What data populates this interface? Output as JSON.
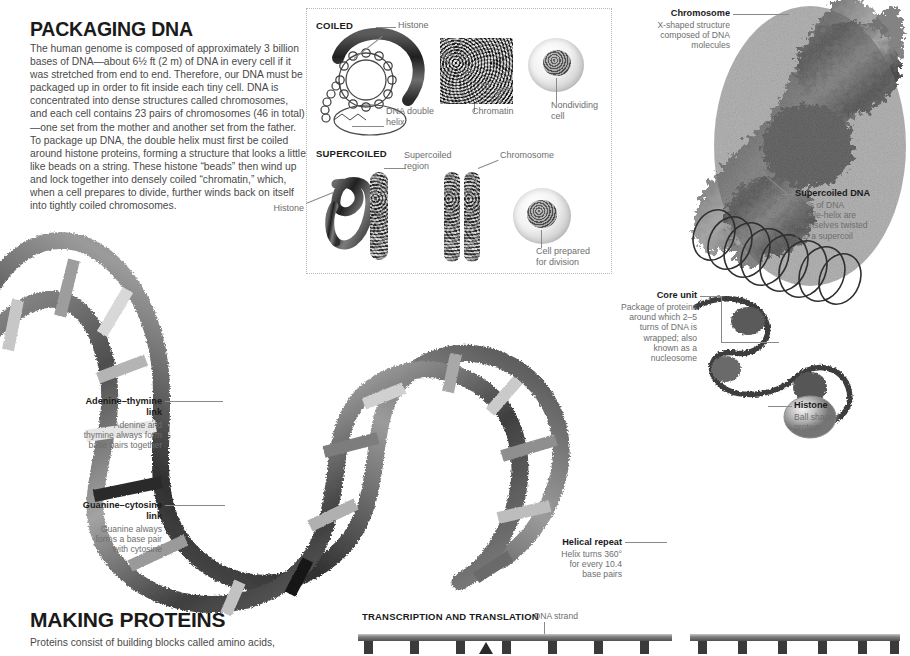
{
  "page": {
    "background": "#ffffff",
    "ink": "#3a3a3a",
    "heading_color": "#1a1a1a",
    "label_gray": "#6e6e6e",
    "leader_color": "#8a8a8a"
  },
  "sections": {
    "packaging": {
      "heading": "PACKAGING DNA",
      "body": "The human genome is composed of approximately 3 billion bases of DNA—about 6½ ft (2 m) of DNA in every cell if it was stretched from end to end. Therefore, our DNA must be packaged up in order to fit inside each tiny cell. DNA is concentrated into dense structures called chromosomes, and each cell contains 23 pairs of chromosomes (46 in total)—one set from the mother and another set from the father. To package up DNA, the double helix must first be coiled around histone proteins, forming a structure that looks a little like beads on a string. These histone “beads” then wind up and lock together into densely coiled “chromatin,” which, when a cell prepares to divide, further winds back on itself into tightly coiled chromosomes."
    },
    "making_proteins": {
      "heading": "MAKING PROTEINS",
      "body": "Proteins consist of building blocks called amino acids,"
    }
  },
  "inset": {
    "coiled": {
      "heading": "COILED",
      "labels": {
        "histone": "Histone",
        "dna_double_helix": "DNA double\nhelix",
        "chromatin": "Chromatin",
        "nondividing_cell": "Nondividing\ncell"
      }
    },
    "supercoiled": {
      "heading": "SUPERCOILED",
      "labels": {
        "histone": "Histone",
        "supercoiled_region": "Supercoiled\nregion",
        "chromosome": "Chromosome",
        "cell_prepared": "Cell prepared\nfor division"
      }
    }
  },
  "callouts": {
    "chromosome": {
      "title": "Chromosome",
      "desc": "X-shaped structure\ncomposed of DNA\nmolecules"
    },
    "supercoiled_dna": {
      "title": "Supercoiled DNA",
      "desc": "Coils of DNA\ndouble-helix are\nthemselves twisted\ninto a supercoil"
    },
    "core_unit": {
      "title": "Core unit",
      "desc": "Package of proteins\naround which 2–5\nturns of DNA is\nwrapped; also\nknown as a\nnucleosome"
    },
    "histone": {
      "title": "Histone",
      "desc": "Ball shaped\nprotein"
    },
    "adenine_thymine": {
      "title": "Adenine–thymine\nlink",
      "desc": "Adenine and\nthymine always form\nbase pairs together"
    },
    "guanine_cytosine": {
      "title": "Guanine–cytosine\nlink",
      "desc": "Guanine always\nforms a base pair\nwith cytosine"
    },
    "helical_repeat": {
      "title": "Helical repeat",
      "desc": "Helix turns 360°\nfor every 10.4\nbase pairs"
    }
  },
  "transcription": {
    "heading": "TRANSCRIPTION AND TRANSLATION",
    "dna_strand_label": "DNA strand"
  }
}
